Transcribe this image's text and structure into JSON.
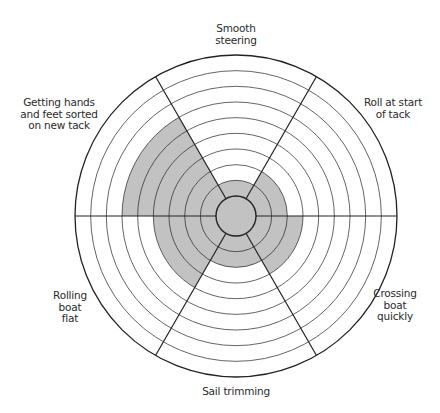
{
  "chart_data": {
    "type": "radial-wheel",
    "title": "",
    "scale": {
      "min": 0,
      "max": 10,
      "rings": 10,
      "grid": true
    },
    "categories": [
      "Smooth steering",
      "Roll at start of tack",
      "Crossing boat quickly",
      "Sail trimming",
      "Rolling boat flat",
      "Getting hands and feet sorted on new tack"
    ],
    "values": [
      2,
      3,
      4,
      3,
      5,
      7
    ],
    "fill_color": "#c2c2c2",
    "line_color": "#222222"
  },
  "labels": {
    "smooth_steering": "Smooth\nsteering",
    "roll_at_start": "Roll at start\nof tack",
    "crossing_boat": "Crossing\nboat\nquickly",
    "sail_trimming": "Sail trimming",
    "rolling_boat_flat": "Rolling\nboat\nflat",
    "hands_and_feet": "Getting hands\nand feet sorted\non new tack"
  }
}
